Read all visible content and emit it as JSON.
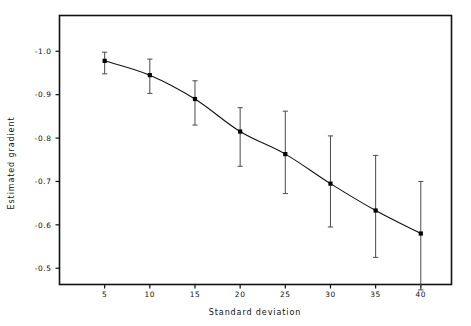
{
  "figure": {
    "background_color": "#ffffff",
    "frame_color": "#111111",
    "line_color": "#111111",
    "marker_color": "#000000",
    "errorbar_color": "#4a4a4a"
  },
  "chart_data": {
    "type": "line",
    "title": "",
    "xlabel": "Standard deviation",
    "ylabel": "Estimated gradient",
    "x": [
      5,
      10,
      15,
      20,
      25,
      30,
      35,
      40
    ],
    "values": [
      -0.978,
      -0.945,
      -0.89,
      -0.815,
      -0.763,
      -0.695,
      -0.633,
      -0.58
    ],
    "error_low": [
      -0.998,
      -0.982,
      -0.932,
      -0.87,
      -0.862,
      -0.805,
      -0.76,
      -0.7
    ],
    "error_high": [
      -0.948,
      -0.903,
      -0.83,
      -0.735,
      -0.672,
      -0.595,
      -0.525,
      -0.45
    ],
    "series": [
      {
        "name": "Estimated gradient",
        "values": [
          -0.978,
          -0.945,
          -0.89,
          -0.815,
          -0.763,
          -0.695,
          -0.633,
          -0.58
        ]
      }
    ],
    "xlim": [
      0,
      43.4
    ],
    "ylim": [
      -1.0825,
      -0.4625
    ],
    "y_axis_inverted": true,
    "grid": false,
    "legend": "none",
    "xticks": [
      5,
      10,
      15,
      20,
      25,
      30,
      35,
      40
    ],
    "xtick_labels": [
      "5",
      "10",
      "15",
      "20",
      "25",
      "30",
      "35",
      "40"
    ],
    "yticks": [
      -1.0,
      -0.9,
      -0.8,
      -0.7,
      -0.6,
      -0.5
    ],
    "ytick_labels": [
      "-1.0",
      "-0.9",
      "-0.8",
      "-0.7",
      "-0.6",
      "-0.5"
    ]
  }
}
